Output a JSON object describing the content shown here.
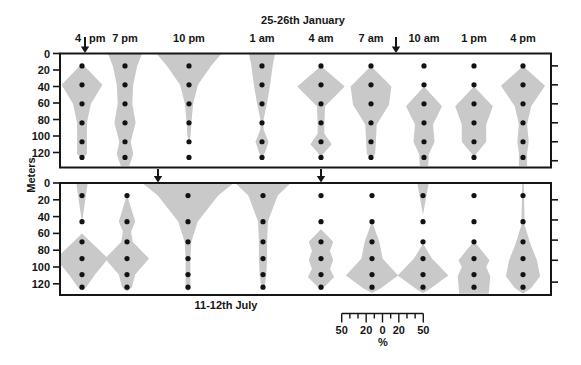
{
  "figure": {
    "top_title": "25-26th January",
    "bottom_title": "11-12th July",
    "y_axis_label": "Meters",
    "width_unit_label": "%"
  },
  "colors": {
    "kite_fill": "#c9c9c9",
    "ink": "#161616",
    "background": "#ffffff"
  },
  "scale_bar": {
    "center_x_px": 382.5,
    "y_px": 313.5,
    "px_per_percent": 0.816,
    "tick_values": [
      -50,
      -40,
      -30,
      -20,
      -10,
      0,
      10,
      20,
      30,
      40,
      50
    ],
    "long_tick_values": [
      -50,
      -20,
      0,
      20,
      50
    ],
    "labels": [
      {
        "value": -50,
        "text": "50"
      },
      {
        "value": -20,
        "text": "20"
      },
      {
        "value": 0,
        "text": "0"
      },
      {
        "value": 20,
        "text": "20"
      },
      {
        "value": 50,
        "text": "50"
      }
    ],
    "unit": "%"
  },
  "chart_data": [
    {
      "panel": "january",
      "type": "area",
      "subtype": "kite diagram: % of population vs depth at each sampling time",
      "title": "25-26th January",
      "ylabel": "Meters",
      "ylim_m": [
        0,
        138
      ],
      "yticks_m": [
        0,
        20,
        40,
        60,
        80,
        100,
        120
      ],
      "right_tick_depths_m": [
        15,
        38,
        61,
        84,
        107,
        130
      ],
      "dots_m": [
        15,
        38,
        61,
        84,
        107,
        126
      ],
      "show_time_labels": true,
      "arrows_px": [
        {
          "x_px": 85
        },
        {
          "x_px": 396
        }
      ],
      "columns": [
        {
          "time": "4 pm",
          "label_parts": [
            "4",
            "pm"
          ],
          "x_px": 82,
          "kites_pct": [
            [
              [
                12,
                0
              ],
              [
                38,
                25
              ],
              [
                61,
                11
              ],
              [
                84,
                6
              ],
              [
                107,
                6
              ],
              [
                122,
                6
              ],
              [
                128,
                0
              ]
            ]
          ]
        },
        {
          "time": "7 pm",
          "x_px": 125,
          "kites_pct": [
            [
              [
                0,
                21
              ],
              [
                15,
                15
              ],
              [
                38,
                10
              ],
              [
                61,
                9
              ],
              [
                84,
                13
              ],
              [
                107,
                7
              ],
              [
                122,
                10
              ],
              [
                138,
                5
              ]
            ]
          ]
        },
        {
          "time": "10 pm",
          "x_px": 189,
          "kites_pct": [
            [
              [
                0,
                40
              ],
              [
                15,
                27
              ],
              [
                38,
                11
              ],
              [
                61,
                5
              ],
              [
                84,
                3
              ],
              [
                100,
                2
              ],
              [
                107,
                0
              ]
            ]
          ]
        },
        {
          "time": "1 am",
          "x_px": 262,
          "kites_pct": [
            [
              [
                0,
                16
              ],
              [
                15,
                13
              ],
              [
                38,
                10
              ],
              [
                61,
                6
              ],
              [
                80,
                2
              ],
              [
                92,
                2
              ],
              [
                107,
                8
              ],
              [
                119,
                4
              ],
              [
                126,
                0
              ]
            ]
          ]
        },
        {
          "time": "4 am",
          "x_px": 321,
          "kites_pct": [
            [
              [
                15,
                0
              ],
              [
                40,
                29
              ],
              [
                64,
                5
              ],
              [
                88,
                4
              ],
              [
                97,
                4
              ],
              [
                110,
                13
              ],
              [
                125,
                0
              ]
            ]
          ]
        },
        {
          "time": "7 am",
          "x_px": 371,
          "kites_pct": [
            [
              [
                15,
                0
              ],
              [
                40,
                25
              ],
              [
                62,
                22
              ],
              [
                86,
                7
              ],
              [
                107,
                6
              ],
              [
                122,
                5
              ],
              [
                128,
                0
              ]
            ]
          ]
        },
        {
          "time": "10 am",
          "x_px": 424,
          "kites_pct": [
            [
              [
                40,
                0
              ],
              [
                64,
                22
              ],
              [
                86,
                11
              ],
              [
                107,
                13
              ],
              [
                122,
                6
              ],
              [
                138,
                5
              ]
            ]
          ]
        },
        {
          "time": "1 pm",
          "x_px": 474,
          "kites_pct": [
            [
              [
                40,
                0
              ],
              [
                64,
                23
              ],
              [
                86,
                15
              ],
              [
                107,
                15
              ],
              [
                120,
                4
              ],
              [
                125,
                0
              ]
            ]
          ]
        },
        {
          "time": "4 pm",
          "x_px": 523,
          "kites_pct": [
            [
              [
                15,
                0
              ],
              [
                39,
                27
              ],
              [
                64,
                10
              ],
              [
                86,
                5
              ],
              [
                107,
                7
              ],
              [
                121,
                5
              ],
              [
                138,
                5
              ]
            ]
          ]
        }
      ]
    },
    {
      "panel": "july",
      "type": "area",
      "subtype": "kite diagram: % of population vs depth at each sampling time",
      "title": "11-12th July",
      "ylabel": "Meters",
      "ylim_m": [
        0,
        133
      ],
      "yticks_m": [
        0,
        20,
        40,
        60,
        80,
        100,
        120
      ],
      "right_tick_depths_m": [
        20,
        44,
        68,
        92,
        118
      ],
      "dots_m": [
        15,
        46,
        70,
        90,
        109,
        124
      ],
      "show_time_labels": false,
      "arrows_px": [
        {
          "x_px": 158
        },
        {
          "x_px": 321
        }
      ],
      "columns": [
        {
          "time": "4 pm",
          "x_px": 82,
          "kites_pct": [
            [
              [
                0,
                7
              ],
              [
                20,
                4
              ],
              [
                48,
                0
              ]
            ],
            [
              [
                60,
                0
              ],
              [
                90,
                32
              ],
              [
                109,
                16
              ],
              [
                124,
                5
              ],
              [
                128,
                0
              ]
            ]
          ]
        },
        {
          "time": "7 pm",
          "x_px": 127,
          "kites_pct": [
            [
              [
                14,
                0
              ],
              [
                46,
                10
              ],
              [
                58,
                5
              ],
              [
                70,
                7
              ],
              [
                90,
                27
              ],
              [
                109,
                10
              ],
              [
                124,
                6
              ],
              [
                129,
                0
              ]
            ]
          ]
        },
        {
          "time": "10 pm",
          "x_px": 188,
          "kites_pct": [
            [
              [
                0,
                56
              ],
              [
                15,
                37
              ],
              [
                46,
                12
              ],
              [
                70,
                4
              ],
              [
                90,
                3
              ],
              [
                109,
                3
              ],
              [
                124,
                3
              ],
              [
                129,
                0
              ]
            ]
          ]
        },
        {
          "time": "1 am",
          "x_px": 263,
          "kites_pct": [
            [
              [
                0,
                34
              ],
              [
                15,
                18
              ],
              [
                46,
                6
              ],
              [
                70,
                5
              ],
              [
                90,
                5
              ],
              [
                110,
                4
              ],
              [
                124,
                2
              ],
              [
                127,
                0
              ]
            ]
          ]
        },
        {
          "time": "4 am",
          "x_px": 321,
          "kites_pct": [
            [
              [
                55,
                0
              ],
              [
                70,
                15
              ],
              [
                81,
                11
              ],
              [
                92,
                15
              ],
              [
                102,
                11
              ],
              [
                112,
                16
              ],
              [
                126,
                2
              ],
              [
                128,
                0
              ]
            ]
          ]
        },
        {
          "time": "7 am",
          "x_px": 372,
          "kites_pct": [
            [
              [
                46,
                0
              ],
              [
                70,
                9
              ],
              [
                90,
                13
              ],
              [
                110,
                32
              ],
              [
                126,
                10
              ],
              [
                131,
                0
              ]
            ]
          ]
        },
        {
          "time": "10 am",
          "x_px": 423,
          "kites_pct": [
            [
              [
                0,
                7
              ],
              [
                38,
                0
              ]
            ],
            [
              [
                72,
                0
              ],
              [
                90,
                11
              ],
              [
                110,
                31
              ],
              [
                127,
                7
              ],
              [
                131,
                0
              ]
            ]
          ]
        },
        {
          "time": "1 pm",
          "x_px": 474,
          "kites_pct": [
            [
              [
                69,
                0
              ],
              [
                92,
                19
              ],
              [
                100,
                15
              ],
              [
                111,
                20
              ],
              [
                133,
                18
              ]
            ]
          ]
        },
        {
          "time": "4 pm",
          "x_px": 523,
          "kites_pct": [
            [
              [
                0,
                1
              ],
              [
                50,
                2
              ],
              [
                72,
                9
              ],
              [
                92,
                17
              ],
              [
                111,
                21
              ],
              [
                125,
                10
              ],
              [
                132,
                0
              ]
            ]
          ]
        }
      ]
    }
  ]
}
